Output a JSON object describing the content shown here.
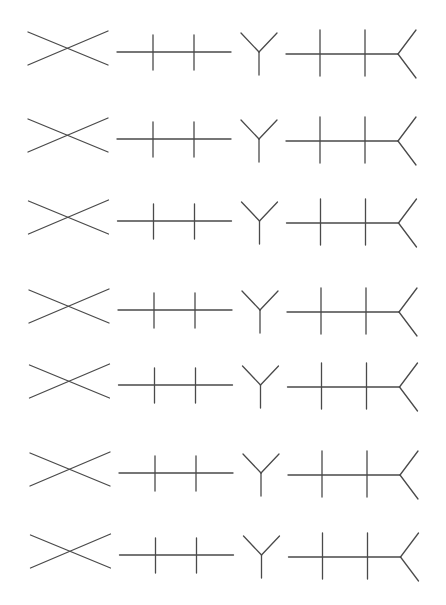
{
  "figure": {
    "line_color": "#4a4a4a",
    "background_color": "#ffffff",
    "row_count": 7,
    "glyphs_per_row": [
      "cross-x",
      "bar-two-ticks",
      "fork-y",
      "bar-two-ticks-forked-end"
    ],
    "rows": [
      {
        "index": 1
      },
      {
        "index": 2
      },
      {
        "index": 3
      },
      {
        "index": 4
      },
      {
        "index": 5
      },
      {
        "index": 6
      },
      {
        "index": 7
      }
    ]
  }
}
